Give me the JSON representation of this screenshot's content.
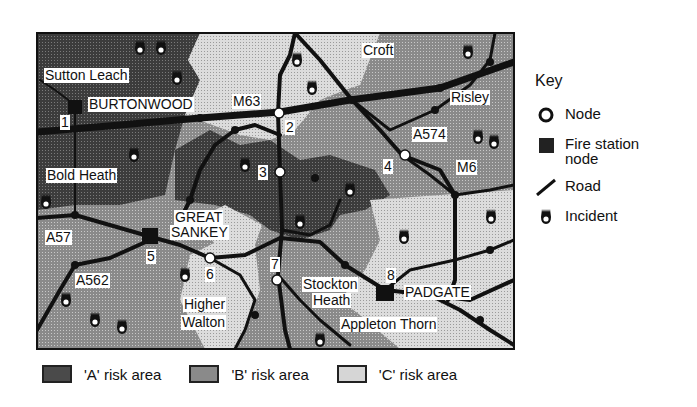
{
  "map": {
    "place_labels": [
      {
        "text": "Sutton Leach",
        "x": 44,
        "y": 68
      },
      {
        "text": "BURTONWOOD",
        "x": 88,
        "y": 97
      },
      {
        "text": "M63",
        "x": 232,
        "y": 94
      },
      {
        "text": "Croft",
        "x": 362,
        "y": 43
      },
      {
        "text": "Risley",
        "x": 450,
        "y": 90
      },
      {
        "text": "A574",
        "x": 412,
        "y": 127
      },
      {
        "text": "M6",
        "x": 456,
        "y": 160
      },
      {
        "text": "Bold Heath",
        "x": 46,
        "y": 168
      },
      {
        "text": "GREAT",
        "x": 174,
        "y": 210
      },
      {
        "text": "SANKEY",
        "x": 170,
        "y": 225
      },
      {
        "text": "A57",
        "x": 45,
        "y": 230
      },
      {
        "text": "A562",
        "x": 75,
        "y": 273
      },
      {
        "text": "Higher",
        "x": 183,
        "y": 297
      },
      {
        "text": "Walton",
        "x": 181,
        "y": 315
      },
      {
        "text": "Stockton",
        "x": 302,
        "y": 277
      },
      {
        "text": "Heath",
        "x": 312,
        "y": 293
      },
      {
        "text": "PADGATE",
        "x": 404,
        "y": 285
      },
      {
        "text": "Appleton Thorn",
        "x": 340,
        "y": 317
      }
    ],
    "node_labels": [
      {
        "text": "1",
        "x": 60,
        "y": 115
      },
      {
        "text": "2",
        "x": 285,
        "y": 120
      },
      {
        "text": "3",
        "x": 258,
        "y": 165
      },
      {
        "text": "4",
        "x": 383,
        "y": 159
      },
      {
        "text": "5",
        "x": 146,
        "y": 249
      },
      {
        "text": "6",
        "x": 205,
        "y": 267
      },
      {
        "text": "7",
        "x": 270,
        "y": 257
      },
      {
        "text": "8",
        "x": 386,
        "y": 268
      }
    ]
  },
  "key": {
    "title": "Key",
    "items": [
      {
        "symbol": "node-icon",
        "label": "Node"
      },
      {
        "symbol": "fire-station-icon",
        "label": "Fire station node"
      },
      {
        "symbol": "road-icon",
        "label": "Road"
      },
      {
        "symbol": "incident-icon",
        "label": "Incident"
      }
    ]
  },
  "legend": {
    "items": [
      {
        "label": "'A' risk area",
        "color": "#4a4a4a"
      },
      {
        "label": "'B' risk area",
        "color": "#8a8a8a"
      },
      {
        "label": "'C' risk area",
        "color": "#d6d6d6"
      }
    ]
  },
  "colors": {
    "risk_a": "#4a4a4a",
    "risk_b": "#8c8c8c",
    "risk_c": "#d4d4d4",
    "road": "#111111",
    "node_fill": "#ffffff"
  }
}
